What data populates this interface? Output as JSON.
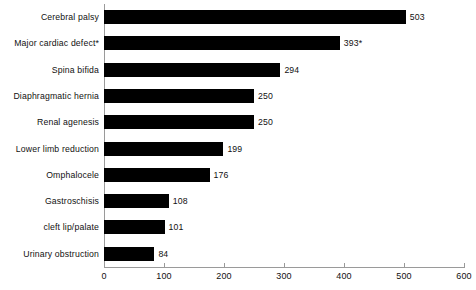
{
  "chart_data": {
    "type": "bar",
    "orientation": "horizontal",
    "title": "",
    "subtitle": "",
    "xlabel": "",
    "ylabel": "",
    "xlim": [
      0,
      600
    ],
    "xticks": [
      0,
      100,
      200,
      300,
      400,
      500,
      600
    ],
    "xtick_labels": [
      "0",
      "100",
      "200",
      "300",
      "400",
      "500",
      "600"
    ],
    "grid": false,
    "legend": null,
    "bar_color": "#000000",
    "axis_color": "#9a9a9a",
    "text_color": "#111111",
    "background": "#ffffff",
    "categories": [
      "Cerebral palsy",
      "Major cardiac defect*",
      "Spina bifida",
      "Diaphragmatic hernia",
      "Renal agenesis",
      "Lower limb reduction",
      "Omphalocele",
      "Gastroschisis",
      "cleft lip/palate",
      "Urinary obstruction"
    ],
    "values": [
      503,
      393,
      294,
      250,
      250,
      199,
      176,
      108,
      101,
      84
    ],
    "value_labels": [
      "503",
      "393*",
      "294",
      "250",
      "250",
      "199",
      "176",
      "108",
      "101",
      "84"
    ],
    "annotations": [
      "* asterisk marks Major cardiac defect value 393"
    ]
  },
  "rows": [
    {
      "label": "Cerebral palsy",
      "value": 503,
      "value_label": "503"
    },
    {
      "label": "Major cardiac defect*",
      "value": 393,
      "value_label": "393*"
    },
    {
      "label": "Spina bifida",
      "value": 294,
      "value_label": "294"
    },
    {
      "label": "Diaphragmatic hernia",
      "value": 250,
      "value_label": "250"
    },
    {
      "label": "Renal agenesis",
      "value": 250,
      "value_label": "250"
    },
    {
      "label": "Lower limb reduction",
      "value": 199,
      "value_label": "199"
    },
    {
      "label": "Omphalocele",
      "value": 176,
      "value_label": "176"
    },
    {
      "label": "Gastroschisis",
      "value": 108,
      "value_label": "108"
    },
    {
      "label": "cleft lip/palate",
      "value": 101,
      "value_label": "101"
    },
    {
      "label": "Urinary obstruction",
      "value": 84,
      "value_label": "84"
    }
  ],
  "axis": {
    "ticks": [
      {
        "label": "0",
        "value": 0
      },
      {
        "label": "100",
        "value": 100
      },
      {
        "label": "200",
        "value": 200
      },
      {
        "label": "300",
        "value": 300
      },
      {
        "label": "400",
        "value": 400
      },
      {
        "label": "500",
        "value": 500
      },
      {
        "label": "600",
        "value": 600
      }
    ]
  }
}
